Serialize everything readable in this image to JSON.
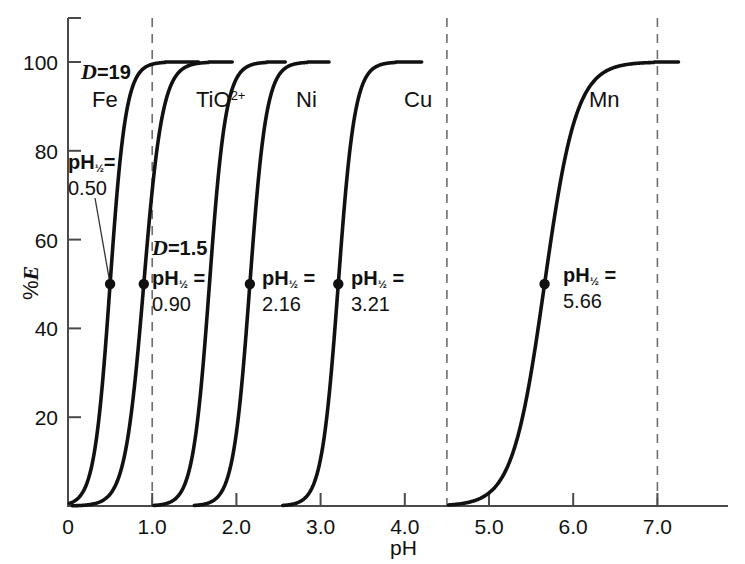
{
  "chart_data": {
    "type": "line",
    "title": "",
    "xlabel": "pH",
    "ylabel": "%E",
    "xlim": [
      0,
      7.6
    ],
    "ylim": [
      0,
      106
    ],
    "xticks": [
      "0",
      "1.0",
      "2.0",
      "3.0",
      "4.0",
      "5.0",
      "6.0",
      "7.0"
    ],
    "xtick_values": [
      0,
      1,
      2,
      3,
      4,
      5,
      6,
      7
    ],
    "yticks": [
      "20",
      "40",
      "60",
      "80",
      "100"
    ],
    "ytick_values": [
      20,
      40,
      60,
      80,
      100
    ],
    "grid": false,
    "legend": "inline-curve-labels",
    "vertical_reference_lines": [
      1.0,
      4.5,
      7.0
    ],
    "series": [
      {
        "name": "Fe",
        "label": "Fe",
        "ph_half": 0.5,
        "ph_half_text": "0.50",
        "D": "19",
        "D_text": "D=19",
        "start_ph": 0.02,
        "end_ph": 1.55,
        "steepness": 4.6
      },
      {
        "name": "TiO2+",
        "label": "TiO2+",
        "ph_half": 0.9,
        "ph_half_text": "0.90",
        "D": "1.5",
        "D_text": "D=1.5",
        "start_ph": 0.05,
        "end_ph": 1.95,
        "steepness": 3.9
      },
      {
        "name": "TiO2+b",
        "label": "TiO2+",
        "ph_half": 1.68,
        "ph_half_text": "",
        "D": "",
        "D_text": "",
        "start_ph": 1.02,
        "end_ph": 2.58,
        "steepness": 4.4
      },
      {
        "name": "Ni",
        "label": "Ni",
        "ph_half": 2.16,
        "ph_half_text": "2.16",
        "D": "",
        "D_text": "",
        "start_ph": 1.5,
        "end_ph": 3.1,
        "steepness": 4.4
      },
      {
        "name": "Cu",
        "label": "Cu",
        "ph_half": 3.21,
        "ph_half_text": "3.21",
        "D": "",
        "D_text": "",
        "start_ph": 2.55,
        "end_ph": 4.2,
        "steepness": 4.4
      },
      {
        "name": "Mn",
        "label": "Mn",
        "ph_half": 5.66,
        "ph_half_text": "5.66",
        "D": "",
        "D_text": "",
        "start_ph": 4.52,
        "end_ph": 7.25,
        "steepness": 2.3
      }
    ],
    "markers": [
      {
        "series": "Fe",
        "ph": 0.5,
        "pct": 50
      },
      {
        "series": "Ti",
        "ph": 0.9,
        "pct": 50
      },
      {
        "series": "Ni",
        "ph": 2.16,
        "pct": 50
      },
      {
        "series": "Cu",
        "ph": 3.21,
        "pct": 50
      },
      {
        "series": "Mn",
        "ph": 5.66,
        "pct": 50
      }
    ]
  },
  "annotations": {
    "d_fe_prefix": "D",
    "d_fe_value": "=19",
    "d_ti_prefix": "D",
    "d_ti_value": "=1.5",
    "fe_label": "Fe",
    "ti_label_base": "TiO",
    "ti_label_sup": "2+",
    "ni_label": "Ni",
    "cu_label": "Cu",
    "mn_label": "Mn",
    "ph_prefix": "pH",
    "ph_half_sub": "½",
    "ph_eq_fe": "=",
    "ph_eq": " =",
    "ph_half_fe": "0.50",
    "ph_half_ti": "0.90",
    "ph_half_ni": "2.16",
    "ph_half_cu": "3.21",
    "ph_half_mn": "5.66"
  },
  "axes": {
    "y_title_pct": "%",
    "y_title_e": "E",
    "x_title": "pH"
  },
  "colors": {
    "curve": "#111111",
    "axis": "#4a4a4a",
    "dashed": "#6e6e6e",
    "background": "#ffffff"
  }
}
